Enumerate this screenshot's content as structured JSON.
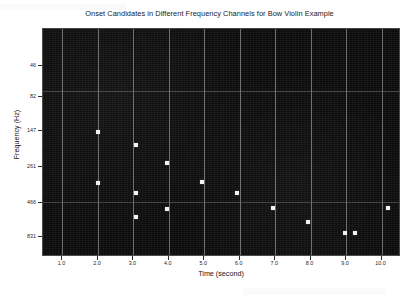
{
  "chart_data": {
    "type": "scatter",
    "title": "Onset Candidates in Different Frequency Channels for Bow Violin Example",
    "xlabel": "Time (second)",
    "ylabel": "Frequency (Hz)",
    "xlim": [
      0.45,
      10.55
    ],
    "ylim_index": [
      0,
      7
    ],
    "grid": true,
    "legend": null,
    "background": "#0b0b0b",
    "marker_color": "#f2f2f2",
    "grid_color": "#8f8f8f",
    "xticks": [
      "1.0",
      "2.0",
      "3.0",
      "4.0",
      "5.0",
      "6.0",
      "7.0",
      "8.0",
      "9.0",
      "10.0"
    ],
    "xtick_values": [
      1.0,
      2.0,
      3.0,
      4.0,
      5.0,
      6.0,
      7.0,
      8.0,
      9.0,
      10.0
    ],
    "yticks": [
      "46",
      "82",
      "147",
      "261",
      "466",
      "831"
    ],
    "ytick_values": [
      46,
      82,
      147,
      261,
      466,
      831
    ],
    "points": [
      {
        "time": 1.25,
        "freq": 261,
        "x_px": 97,
        "y_px": 131
      },
      {
        "time": 1.25,
        "freq": 466,
        "x_px": 97,
        "y_px": 182
      },
      {
        "time": 2.32,
        "freq": 300,
        "x_px": 135,
        "y_px": 144
      },
      {
        "time": 2.32,
        "freq": 560,
        "x_px": 135,
        "y_px": 192
      },
      {
        "time": 2.32,
        "freq": 880,
        "x_px": 135,
        "y_px": 216
      },
      {
        "time": 3.2,
        "freq": 370,
        "x_px": 166,
        "y_px": 162
      },
      {
        "time": 3.2,
        "freq": 810,
        "x_px": 166,
        "y_px": 208
      },
      {
        "time": 4.18,
        "freq": 466,
        "x_px": 201,
        "y_px": 181
      },
      {
        "time": 5.18,
        "freq": 560,
        "x_px": 236,
        "y_px": 192
      },
      {
        "time": 6.2,
        "freq": 810,
        "x_px": 272,
        "y_px": 207
      },
      {
        "time": 7.2,
        "freq": 1050,
        "x_px": 307,
        "y_px": 221
      },
      {
        "time": 8.25,
        "freq": 1250,
        "x_px": 344,
        "y_px": 232
      },
      {
        "time": 8.52,
        "freq": 1250,
        "x_px": 354,
        "y_px": 232
      },
      {
        "time": 9.5,
        "freq": 810,
        "x_px": 387,
        "y_px": 207
      }
    ]
  }
}
